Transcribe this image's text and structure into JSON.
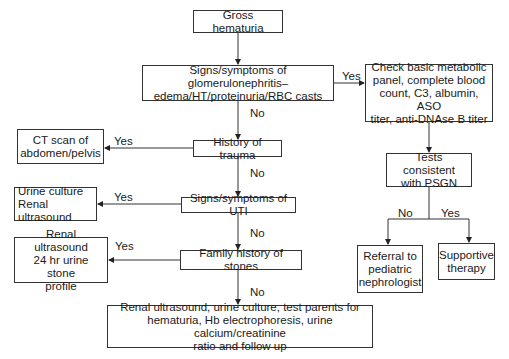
{
  "diagram": {
    "type": "flowchart",
    "nodes": {
      "gross_hematuria": "Gross hematuria",
      "glomerulonephritis": "Signs/symptoms of glomerulonephritis–\nedema/HT/proteinuria/RBC casts",
      "check_labs": "Check basic metabolic\npanel, complete blood\ncount, C3, albumin, ASO\ntiter, anti-DNAse B titer",
      "tests_psgn": "Tests consistent\nwith PSGN",
      "referral": "Referral to\npediatric\nnephrologist",
      "supportive": "Supportive\ntherapy",
      "history_trauma": "History of trauma",
      "ct_scan": "CT scan of\nabdomen/pelvis",
      "uti": "Signs/symptoms of UTI",
      "urine_culture": "Urine culture\nRenal ultrasound",
      "family_stones": "Family history of stones",
      "renal_stone": "Renal ultrasound\n24 hr urine stone\nprofile",
      "final": "Renal ultrasound, urine culture, test parents for\nhematuria, Hb electrophoresis, urine calcium/creatinine\nratio and follow up"
    },
    "edge_labels": {
      "glom_yes": "Yes",
      "glom_no": "No",
      "trauma_yes": "Yes",
      "trauma_no": "No",
      "uti_yes": "Yes",
      "uti_no": "No",
      "stones_yes": "Yes",
      "stones_no": "No",
      "psgn_no": "No",
      "psgn_yes": "Yes"
    },
    "edges": [
      {
        "from": "gross_hematuria",
        "to": "glomerulonephritis",
        "label": ""
      },
      {
        "from": "glomerulonephritis",
        "to": "check_labs",
        "label": "Yes"
      },
      {
        "from": "glomerulonephritis",
        "to": "history_trauma",
        "label": "No"
      },
      {
        "from": "check_labs",
        "to": "tests_psgn",
        "label": ""
      },
      {
        "from": "tests_psgn",
        "to": "referral",
        "label": "No"
      },
      {
        "from": "tests_psgn",
        "to": "supportive",
        "label": "Yes"
      },
      {
        "from": "history_trauma",
        "to": "ct_scan",
        "label": "Yes"
      },
      {
        "from": "history_trauma",
        "to": "uti",
        "label": "No"
      },
      {
        "from": "uti",
        "to": "urine_culture",
        "label": "Yes"
      },
      {
        "from": "uti",
        "to": "family_stones",
        "label": "No"
      },
      {
        "from": "family_stones",
        "to": "renal_stone",
        "label": "Yes"
      },
      {
        "from": "family_stones",
        "to": "final",
        "label": "No"
      }
    ]
  }
}
